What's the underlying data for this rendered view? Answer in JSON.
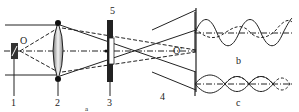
{
  "diagram": {
    "panel_a": {
      "caption": "a",
      "labels": {
        "component_1": "1",
        "component_2": "2",
        "component_3": "3",
        "component_4": "4",
        "component_5": "5",
        "point_O": "O",
        "point_O_prime": "O'"
      }
    },
    "panel_b": {
      "caption": "b"
    },
    "panel_c": {
      "caption": "c"
    }
  }
}
